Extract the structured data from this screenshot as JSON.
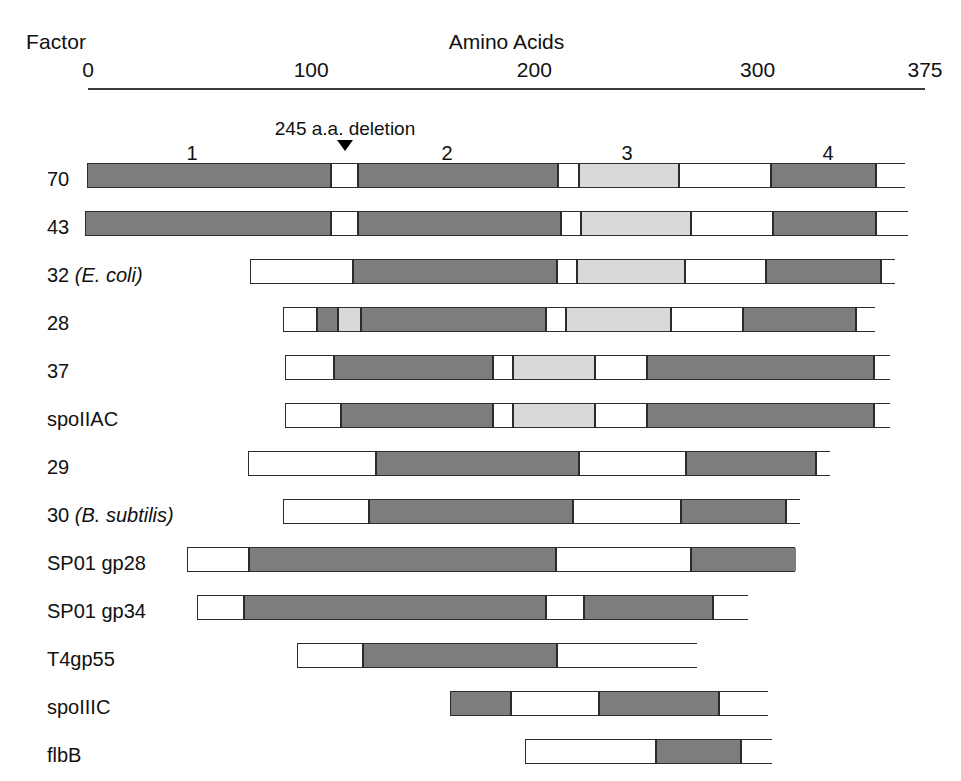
{
  "header": {
    "factor_label": "Factor",
    "axis_title": "Amino Acids"
  },
  "axis": {
    "ticks": [
      {
        "label": "0",
        "value": 0
      },
      {
        "label": "100",
        "value": 100
      },
      {
        "label": "200",
        "value": 200
      },
      {
        "label": "300",
        "value": 300
      },
      {
        "label": "375",
        "value": 375
      }
    ],
    "range": [
      0,
      375
    ],
    "line_x0": 88,
    "line_x1": 925,
    "line_y": 88,
    "label_y": 58
  },
  "annotation": {
    "deletion_text": "245 a.a. deletion",
    "deletion_x": 345,
    "deletion_label_y": 118,
    "deletion_marker_y": 140
  },
  "regions": [
    {
      "label": "1",
      "x": 192
    },
    {
      "label": "2",
      "x": 447
    },
    {
      "label": "3",
      "x": 627
    },
    {
      "label": "4",
      "x": 828
    }
  ],
  "region_label_y": 142,
  "colors": {
    "dark": "#7d7d7d",
    "light": "#d9d9d9",
    "white": "#ffffff",
    "outline": "#2b2b2b",
    "axis": "#3a3a3a",
    "text": "#111111"
  },
  "legend_note": {
    "dark_meaning": "conserved region",
    "light_meaning": "less conserved region",
    "white_meaning": "non-conserved region"
  },
  "rows": [
    {
      "label": "70",
      "species": "",
      "label_y": 168,
      "bar_y": 163,
      "x0": 87,
      "x1": 905,
      "segments": [
        {
          "type": "dark",
          "x0": 87,
          "x1": 330
        },
        {
          "type": "white",
          "x0": 330,
          "x1": 357
        },
        {
          "type": "dark",
          "x0": 357,
          "x1": 557
        },
        {
          "type": "white",
          "x0": 557,
          "x1": 578
        },
        {
          "type": "light",
          "x0": 578,
          "x1": 678
        },
        {
          "type": "white",
          "x0": 678,
          "x1": 770
        },
        {
          "type": "dark",
          "x0": 770,
          "x1": 875
        },
        {
          "type": "white",
          "x0": 875,
          "x1": 905
        }
      ]
    },
    {
      "label": "43",
      "species": "",
      "label_y": 216,
      "bar_y": 211,
      "x0": 85,
      "x1": 908,
      "segments": [
        {
          "type": "dark",
          "x0": 85,
          "x1": 330
        },
        {
          "type": "white",
          "x0": 330,
          "x1": 357
        },
        {
          "type": "dark",
          "x0": 357,
          "x1": 560
        },
        {
          "type": "white",
          "x0": 560,
          "x1": 580
        },
        {
          "type": "light",
          "x0": 580,
          "x1": 690
        },
        {
          "type": "white",
          "x0": 690,
          "x1": 772
        },
        {
          "type": "dark",
          "x0": 772,
          "x1": 875
        },
        {
          "type": "white",
          "x0": 875,
          "x1": 908
        }
      ]
    },
    {
      "label": "32",
      "species": "(E. coli)",
      "label_y": 264,
      "bar_y": 259,
      "x0": 250,
      "x1": 895,
      "segments": [
        {
          "type": "white",
          "x0": 250,
          "x1": 352
        },
        {
          "type": "dark",
          "x0": 352,
          "x1": 556
        },
        {
          "type": "white",
          "x0": 556,
          "x1": 576
        },
        {
          "type": "light",
          "x0": 576,
          "x1": 684
        },
        {
          "type": "white",
          "x0": 684,
          "x1": 765
        },
        {
          "type": "dark",
          "x0": 765,
          "x1": 880
        },
        {
          "type": "white",
          "x0": 880,
          "x1": 895
        }
      ]
    },
    {
      "label": "28",
      "species": "",
      "label_y": 312,
      "bar_y": 307,
      "x0": 283,
      "x1": 875,
      "segments": [
        {
          "type": "white",
          "x0": 283,
          "x1": 316
        },
        {
          "type": "dark",
          "x0": 316,
          "x1": 337
        },
        {
          "type": "light",
          "x0": 337,
          "x1": 360
        },
        {
          "type": "dark",
          "x0": 360,
          "x1": 545
        },
        {
          "type": "white",
          "x0": 545,
          "x1": 565
        },
        {
          "type": "light",
          "x0": 565,
          "x1": 670
        },
        {
          "type": "white",
          "x0": 670,
          "x1": 742
        },
        {
          "type": "dark",
          "x0": 742,
          "x1": 855
        },
        {
          "type": "white",
          "x0": 855,
          "x1": 875
        }
      ]
    },
    {
      "label": "37",
      "species": "",
      "label_y": 360,
      "bar_y": 355,
      "x0": 285,
      "x1": 890,
      "segments": [
        {
          "type": "white",
          "x0": 285,
          "x1": 333
        },
        {
          "type": "dark",
          "x0": 333,
          "x1": 492
        },
        {
          "type": "white",
          "x0": 492,
          "x1": 512
        },
        {
          "type": "light",
          "x0": 512,
          "x1": 594
        },
        {
          "type": "white",
          "x0": 594,
          "x1": 646
        },
        {
          "type": "dark",
          "x0": 646,
          "x1": 873
        },
        {
          "type": "white",
          "x0": 873,
          "x1": 890
        }
      ]
    },
    {
      "label": "spoIIAC",
      "species": "",
      "label_y": 408,
      "bar_y": 403,
      "x0": 285,
      "x1": 890,
      "segments": [
        {
          "type": "white",
          "x0": 285,
          "x1": 340
        },
        {
          "type": "dark",
          "x0": 340,
          "x1": 492
        },
        {
          "type": "white",
          "x0": 492,
          "x1": 512
        },
        {
          "type": "light",
          "x0": 512,
          "x1": 594
        },
        {
          "type": "white",
          "x0": 594,
          "x1": 646
        },
        {
          "type": "dark",
          "x0": 646,
          "x1": 873
        },
        {
          "type": "white",
          "x0": 873,
          "x1": 890
        }
      ]
    },
    {
      "label": "29",
      "species": "",
      "label_y": 456,
      "bar_y": 451,
      "x0": 248,
      "x1": 830,
      "segments": [
        {
          "type": "white",
          "x0": 248,
          "x1": 375
        },
        {
          "type": "dark",
          "x0": 375,
          "x1": 578
        },
        {
          "type": "white",
          "x0": 578,
          "x1": 685
        },
        {
          "type": "dark",
          "x0": 685,
          "x1": 815
        },
        {
          "type": "white",
          "x0": 815,
          "x1": 830
        }
      ]
    },
    {
      "label": "30",
      "species": "(B. subtilis)",
      "label_y": 504,
      "bar_y": 499,
      "x0": 283,
      "x1": 800,
      "segments": [
        {
          "type": "white",
          "x0": 283,
          "x1": 368
        },
        {
          "type": "dark",
          "x0": 368,
          "x1": 572
        },
        {
          "type": "white",
          "x0": 572,
          "x1": 680
        },
        {
          "type": "dark",
          "x0": 680,
          "x1": 785
        },
        {
          "type": "white",
          "x0": 785,
          "x1": 800
        }
      ]
    },
    {
      "label": "SP01 gp28",
      "species": "",
      "label_y": 552,
      "bar_y": 547,
      "x0": 187,
      "x1": 795,
      "segments": [
        {
          "type": "white",
          "x0": 187,
          "x1": 248
        },
        {
          "type": "dark",
          "x0": 248,
          "x1": 555
        },
        {
          "type": "white",
          "x0": 555,
          "x1": 690
        },
        {
          "type": "dark",
          "x0": 690,
          "x1": 795
        }
      ]
    },
    {
      "label": "SP01 gp34",
      "species": "",
      "label_y": 600,
      "bar_y": 595,
      "x0": 197,
      "x1": 748,
      "segments": [
        {
          "type": "white",
          "x0": 197,
          "x1": 243
        },
        {
          "type": "dark",
          "x0": 243,
          "x1": 545
        },
        {
          "type": "white",
          "x0": 545,
          "x1": 583
        },
        {
          "type": "dark",
          "x0": 583,
          "x1": 712
        },
        {
          "type": "white",
          "x0": 712,
          "x1": 748
        }
      ]
    },
    {
      "label": "T4gp55",
      "species": "",
      "label_y": 648,
      "bar_y": 643,
      "x0": 297,
      "x1": 697,
      "segments": [
        {
          "type": "white",
          "x0": 297,
          "x1": 362
        },
        {
          "type": "dark",
          "x0": 362,
          "x1": 556
        },
        {
          "type": "white",
          "x0": 556,
          "x1": 697
        }
      ]
    },
    {
      "label": "spoIIIC",
      "species": "",
      "label_y": 696,
      "bar_y": 691,
      "x0": 450,
      "x1": 768,
      "segments": [
        {
          "type": "dark",
          "x0": 450,
          "x1": 510
        },
        {
          "type": "white",
          "x0": 510,
          "x1": 598
        },
        {
          "type": "dark",
          "x0": 598,
          "x1": 718
        },
        {
          "type": "white",
          "x0": 718,
          "x1": 768
        }
      ]
    },
    {
      "label": "flbB",
      "species": "",
      "label_y": 744,
      "bar_y": 739,
      "x0": 525,
      "x1": 772,
      "segments": [
        {
          "type": "white",
          "x0": 525,
          "x1": 655
        },
        {
          "type": "dark",
          "x0": 655,
          "x1": 740
        },
        {
          "type": "white",
          "x0": 740,
          "x1": 772
        }
      ]
    }
  ]
}
